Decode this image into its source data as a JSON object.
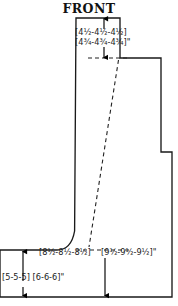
{
  "title": "FRONT",
  "labels": {
    "neck_depth_line1": "[4½-4½-4½]",
    "neck_depth_line2": "[4¾-4¾-4¾]\"",
    "chest_width": "[8½-8½-8½]",
    "total_length": "[9½-9½-9½]\"",
    "hem_height": "[5-5-5] [6-6-6]\""
  },
  "colors": {
    "outline": "#1a1a1a",
    "dashed": "#222222",
    "arrow": "#000000",
    "text": "#1a1a1a",
    "background": "#ffffff"
  },
  "geometry": {
    "outline_path": "M 76,18 L 120,18 L 120,58 L 161,58 L 161,152 L 172,152 L 172,297 L 0,297 L 0,250 L 58,250 C 66,250 72,244 75,232 L 76,18 Z",
    "dashed_segments": [
      "M 88,58 L 128,58",
      "M 118,60 L 89,248",
      "M 75,250 L 128,250"
    ]
  },
  "arrows": [
    {
      "name": "neck-up-arrow",
      "x": 104,
      "y1": 28,
      "y2": 18,
      "dir": "up"
    },
    {
      "name": "neck-down-arrow",
      "x": 104,
      "y1": 48,
      "y2": 58,
      "dir": "down"
    },
    {
      "name": "length-down-arrow",
      "x": 105,
      "y1": 258,
      "y2": 296,
      "dir": "down"
    },
    {
      "name": "hem-up-arrow",
      "x": 23,
      "y1": 282,
      "y2": 252,
      "dir": "up"
    },
    {
      "name": "hem-down-arrow",
      "x": 23,
      "y1": 288,
      "y2": 296,
      "dir": "down"
    }
  ]
}
